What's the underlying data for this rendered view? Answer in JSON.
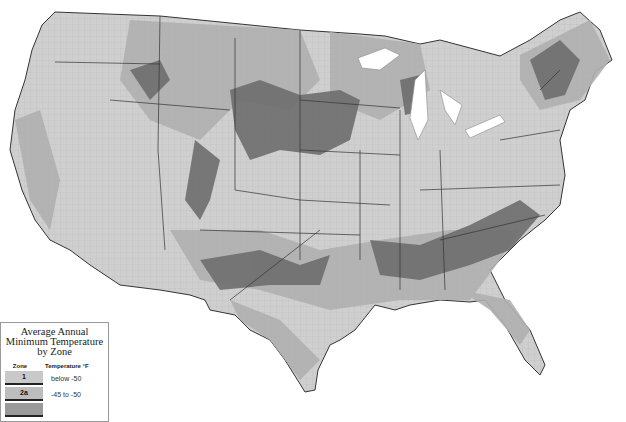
{
  "map": {
    "subject": "USDA Plant Hardiness Zone Map (contiguous United States)",
    "colors": {
      "background": "#ffffff",
      "land_light": "#d8d8d8",
      "land_mid": "#b4b4b4",
      "land_dark": "#7a7a7a",
      "land_darkest": "#5a5a5a",
      "water": "#ffffff",
      "border": "#333333"
    }
  },
  "legend": {
    "title_line1": "Average Annual",
    "title_line2": "Minimum Temperature",
    "title_line3": "by Zone",
    "col_zone": "Zone",
    "col_temp": "Temperature °F",
    "rows": [
      {
        "zone": "1",
        "range": "below -50",
        "color": "#c9c9c9"
      },
      {
        "zone": "2a",
        "range": "-45 to -50",
        "color": "#bdbdbd"
      },
      {
        "zone": "",
        "range": "",
        "color": "#9a9a9a"
      }
    ]
  }
}
